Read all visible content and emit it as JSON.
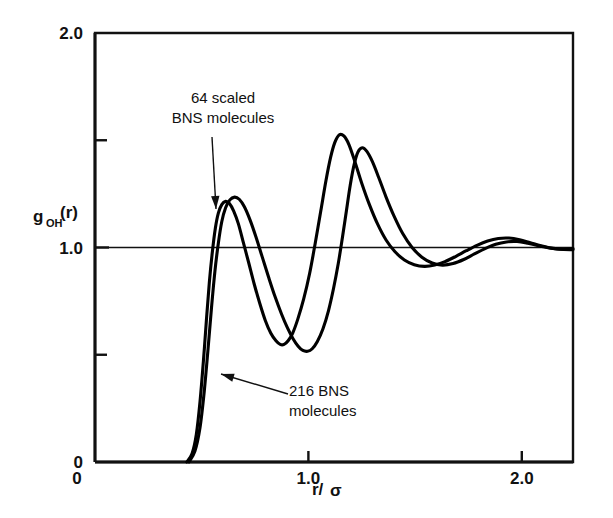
{
  "chart_data": {
    "type": "line",
    "title": "",
    "xlabel": "r/σ",
    "ylabel": "g_OH(r)",
    "ylabel_base": "g",
    "ylabel_sub": "OH",
    "ylabel_tail": "(r)",
    "xlabel_num": "r/",
    "xlabel_sym": "σ",
    "xlim": [
      0,
      2.24
    ],
    "ylim": [
      0,
      2.0
    ],
    "grid": false,
    "legend_position": "inline-annotations",
    "xticks": [
      {
        "value": 0,
        "label": "0",
        "major": true
      },
      {
        "value": 1.0,
        "label": "1.0",
        "major": true
      },
      {
        "value": 2.0,
        "label": "2.0",
        "major": true
      }
    ],
    "yticks": [
      {
        "value": 0,
        "label": "0",
        "major": true
      },
      {
        "value": 0.5,
        "label": "",
        "major": false
      },
      {
        "value": 1.0,
        "label": "1.0",
        "major": true
      },
      {
        "value": 1.5,
        "label": "",
        "major": false
      },
      {
        "value": 2.0,
        "label": "2.0",
        "major": true
      }
    ],
    "reference_line": {
      "y": 1.0,
      "label": "unity reference"
    },
    "series": [
      {
        "name": "64 scaled BNS molecules",
        "color": "#000000",
        "points": [
          [
            0.43,
            0.0
          ],
          [
            0.455,
            0.04
          ],
          [
            0.475,
            0.13
          ],
          [
            0.492,
            0.28
          ],
          [
            0.508,
            0.47
          ],
          [
            0.522,
            0.66
          ],
          [
            0.536,
            0.84
          ],
          [
            0.55,
            0.98
          ],
          [
            0.564,
            1.09
          ],
          [
            0.578,
            1.16
          ],
          [
            0.594,
            1.2
          ],
          [
            0.612,
            1.215
          ],
          [
            0.63,
            1.205
          ],
          [
            0.65,
            1.17
          ],
          [
            0.672,
            1.11
          ],
          [
            0.696,
            1.02
          ],
          [
            0.72,
            0.93
          ],
          [
            0.746,
            0.83
          ],
          [
            0.772,
            0.74
          ],
          [
            0.798,
            0.66
          ],
          [
            0.824,
            0.6
          ],
          [
            0.848,
            0.565
          ],
          [
            0.868,
            0.548
          ],
          [
            0.886,
            0.548
          ],
          [
            0.905,
            0.565
          ],
          [
            0.926,
            0.6
          ],
          [
            0.95,
            0.665
          ],
          [
            0.978,
            0.76
          ],
          [
            1.006,
            0.88
          ],
          [
            1.032,
            1.02
          ],
          [
            1.058,
            1.17
          ],
          [
            1.082,
            1.31
          ],
          [
            1.104,
            1.42
          ],
          [
            1.124,
            1.49
          ],
          [
            1.144,
            1.525
          ],
          [
            1.166,
            1.52
          ],
          [
            1.19,
            1.48
          ],
          [
            1.218,
            1.4
          ],
          [
            1.25,
            1.3
          ],
          [
            1.286,
            1.2
          ],
          [
            1.324,
            1.11
          ],
          [
            1.364,
            1.035
          ],
          [
            1.406,
            0.98
          ],
          [
            1.45,
            0.942
          ],
          [
            1.496,
            0.92
          ],
          [
            1.544,
            0.912
          ],
          [
            1.592,
            0.918
          ],
          [
            1.64,
            0.934
          ],
          [
            1.69,
            0.958
          ],
          [
            1.74,
            0.985
          ],
          [
            1.79,
            1.01
          ],
          [
            1.84,
            1.03
          ],
          [
            1.89,
            1.042
          ],
          [
            1.94,
            1.044
          ],
          [
            1.99,
            1.036
          ],
          [
            2.04,
            1.022
          ],
          [
            2.09,
            1.008
          ],
          [
            2.14,
            0.997
          ],
          [
            2.19,
            0.992
          ],
          [
            2.24,
            0.995
          ]
        ]
      },
      {
        "name": "216 BNS molecules",
        "color": "#000000",
        "points": [
          [
            0.44,
            0.0
          ],
          [
            0.468,
            0.05
          ],
          [
            0.492,
            0.16
          ],
          [
            0.512,
            0.33
          ],
          [
            0.53,
            0.53
          ],
          [
            0.546,
            0.72
          ],
          [
            0.562,
            0.89
          ],
          [
            0.578,
            1.02
          ],
          [
            0.594,
            1.12
          ],
          [
            0.612,
            1.185
          ],
          [
            0.632,
            1.222
          ],
          [
            0.654,
            1.235
          ],
          [
            0.676,
            1.225
          ],
          [
            0.7,
            1.19
          ],
          [
            0.726,
            1.13
          ],
          [
            0.754,
            1.05
          ],
          [
            0.784,
            0.955
          ],
          [
            0.814,
            0.86
          ],
          [
            0.844,
            0.77
          ],
          [
            0.874,
            0.69
          ],
          [
            0.902,
            0.625
          ],
          [
            0.928,
            0.575
          ],
          [
            0.952,
            0.54
          ],
          [
            0.974,
            0.52
          ],
          [
            0.996,
            0.516
          ],
          [
            1.018,
            0.528
          ],
          [
            1.042,
            0.562
          ],
          [
            1.068,
            0.62
          ],
          [
            1.094,
            0.705
          ],
          [
            1.118,
            0.81
          ],
          [
            1.14,
            0.925
          ],
          [
            1.16,
            1.05
          ],
          [
            1.178,
            1.17
          ],
          [
            1.196,
            1.29
          ],
          [
            1.214,
            1.385
          ],
          [
            1.232,
            1.445
          ],
          [
            1.252,
            1.465
          ],
          [
            1.274,
            1.448
          ],
          [
            1.3,
            1.4
          ],
          [
            1.33,
            1.325
          ],
          [
            1.364,
            1.235
          ],
          [
            1.402,
            1.145
          ],
          [
            1.442,
            1.065
          ],
          [
            1.486,
            1.0
          ],
          [
            1.532,
            0.955
          ],
          [
            1.58,
            0.928
          ],
          [
            1.628,
            0.918
          ],
          [
            1.678,
            0.925
          ],
          [
            1.728,
            0.944
          ],
          [
            1.778,
            0.97
          ],
          [
            1.828,
            0.995
          ],
          [
            1.878,
            1.015
          ],
          [
            1.928,
            1.026
          ],
          [
            1.978,
            1.028
          ],
          [
            2.028,
            1.02
          ],
          [
            2.078,
            1.008
          ],
          [
            2.128,
            0.998
          ],
          [
            2.178,
            0.992
          ],
          [
            2.24,
            0.99
          ]
        ]
      }
    ],
    "annotations": [
      {
        "id": "annot-64-scaled",
        "lines": [
          "64 scaled",
          "BNS molecules"
        ],
        "text_x": 223,
        "text_y": 103,
        "anchor": "middle",
        "arrow": {
          "x1": 212,
          "y1": 137,
          "x2": 216,
          "y2": 209
        }
      },
      {
        "id": "annot-216",
        "lines": [
          "216 BNS",
          "molecules"
        ],
        "text_x": 289,
        "text_y": 396,
        "anchor": "start",
        "arrow": {
          "x1": 288,
          "y1": 394,
          "x2": 221,
          "y2": 374
        }
      }
    ]
  },
  "geometry": {
    "plot_left": 95,
    "plot_right": 573,
    "plot_top": 33,
    "plot_bottom": 462
  }
}
